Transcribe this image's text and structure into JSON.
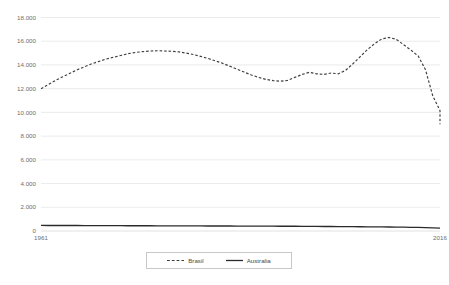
{
  "chart_data": {
    "type": "line",
    "title": "",
    "xlabel": "",
    "ylabel": "",
    "xlim": [
      1961,
      2016
    ],
    "ylim": [
      0,
      18000
    ],
    "grid": true,
    "legend_position": "bottom",
    "y_tick_labels": [
      "18.000",
      "16.000",
      "14.000",
      "12.000",
      "10.000",
      "8.000",
      "6.000",
      "4.000",
      "2.000",
      "0"
    ],
    "y_tick_values": [
      18000,
      16000,
      14000,
      12000,
      10000,
      8000,
      6000,
      4000,
      2000,
      0
    ],
    "x_tick_labels": [
      "1961",
      "2016"
    ],
    "x_tick_values": [
      1961,
      2016
    ],
    "x": [
      1961,
      1962,
      1963,
      1964,
      1965,
      1966,
      1967,
      1968,
      1969,
      1970,
      1971,
      1972,
      1973,
      1974,
      1975,
      1976,
      1977,
      1978,
      1979,
      1980,
      1981,
      1982,
      1983,
      1984,
      1985,
      1986,
      1987,
      1988,
      1989,
      1990,
      1991,
      1992,
      1993,
      1994,
      1995,
      1996,
      1997,
      1998,
      1999,
      2000,
      2001,
      2002,
      2003,
      2004,
      2005,
      2006,
      2007,
      2008,
      2009,
      2010,
      2011,
      2012,
      2013,
      2014,
      2015,
      2016
    ],
    "series": [
      {
        "name": "Brasil",
        "style": "dashed",
        "color": "#3f3f3f",
        "values": [
          12000,
          12350,
          12700,
          13000,
          13300,
          13600,
          13850,
          14100,
          14300,
          14500,
          14650,
          14800,
          14950,
          15050,
          15120,
          15170,
          15200,
          15180,
          15150,
          15100,
          15000,
          14880,
          14720,
          14550,
          14350,
          14150,
          13900,
          13650,
          13400,
          13150,
          12950,
          12780,
          12680,
          12630,
          12700,
          12950,
          13200,
          13380,
          13250,
          13200,
          13320,
          13250,
          13550,
          14100,
          14700,
          15300,
          15800,
          16200,
          16320,
          16150,
          15700,
          15250,
          14750,
          13600,
          11400,
          10150
        ]
      },
      {
        "name": "Australia",
        "style": "solid",
        "color": "#2b2b2b",
        "values": [
          470,
          468,
          466,
          464,
          462,
          460,
          458,
          456,
          454,
          452,
          450,
          448,
          446,
          444,
          442,
          440,
          438,
          436,
          434,
          432,
          430,
          428,
          426,
          424,
          422,
          420,
          418,
          416,
          414,
          412,
          410,
          408,
          405,
          402,
          400,
          397,
          394,
          390,
          386,
          382,
          378,
          374,
          370,
          365,
          360,
          354,
          348,
          342,
          336,
          330,
          322,
          312,
          300,
          285,
          265,
          240
        ]
      }
    ],
    "extra_tail": {
      "note": "final descent segment",
      "x": [
        2016
      ],
      "values": [
        9000
      ]
    }
  },
  "legend": {
    "items": [
      {
        "label": "Brasil",
        "style": "dashed"
      },
      {
        "label": "Australia",
        "style": "solid"
      }
    ]
  }
}
